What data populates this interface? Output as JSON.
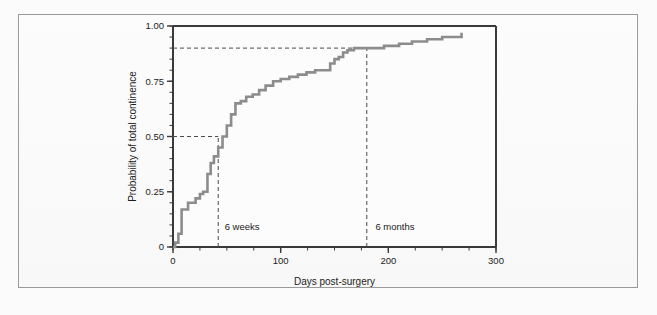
{
  "figure": {
    "background_color": "#fbfbfb",
    "panel_color": "#fcfcfc",
    "border_color": "#9a9a9a",
    "axis_color": "#3a3a3a",
    "curve_color": "#8c8c8c",
    "reference_line_color": "#4a4a4a"
  },
  "chart_data": {
    "type": "line",
    "title": "",
    "subtitle": "",
    "xlabel": "Days post-surgery",
    "ylabel": "Probability of total continence",
    "xlim": [
      0,
      300
    ],
    "ylim": [
      0,
      1.0
    ],
    "grid": false,
    "legend": "none",
    "xticks": [
      0,
      100,
      200,
      300
    ],
    "xtick_labels": [
      "0",
      "100",
      "200",
      "300"
    ],
    "xminor_tick_interval": 25,
    "yticks": [
      0,
      0.25,
      0.5,
      0.75,
      1.0
    ],
    "ytick_labels": [
      "0",
      "0.25",
      "0.50",
      "0.75",
      "1.00"
    ],
    "yminor_tick_interval": 0.05,
    "series": [
      {
        "name": "Cumulative probability of total continence",
        "style": "step-post",
        "color": "#8c8c8c",
        "x": [
          0,
          2,
          5,
          8,
          14,
          21,
          25,
          28,
          32,
          35,
          38,
          42,
          46,
          50,
          54,
          58,
          63,
          68,
          74,
          80,
          86,
          93,
          100,
          108,
          116,
          124,
          132,
          140,
          146,
          150,
          154,
          158,
          162,
          168,
          180,
          196,
          210,
          222,
          236,
          250,
          262,
          268
        ],
        "y": [
          0.0,
          0.02,
          0.06,
          0.17,
          0.2,
          0.22,
          0.24,
          0.25,
          0.33,
          0.38,
          0.41,
          0.45,
          0.5,
          0.55,
          0.6,
          0.65,
          0.66,
          0.68,
          0.69,
          0.71,
          0.73,
          0.75,
          0.76,
          0.77,
          0.78,
          0.79,
          0.8,
          0.8,
          0.83,
          0.85,
          0.86,
          0.88,
          0.89,
          0.9,
          0.9,
          0.91,
          0.92,
          0.93,
          0.94,
          0.95,
          0.95,
          0.97
        ]
      }
    ],
    "annotations": [
      {
        "label": "6 weeks",
        "type": "vertical-reference-line",
        "x": 42,
        "y_top": 0.5,
        "style": "dashed",
        "label_x": 48,
        "label_y": 0.075
      },
      {
        "label": "6 months",
        "type": "vertical-reference-line",
        "x": 180,
        "y_top": 0.9,
        "style": "dashed",
        "label_x": 188,
        "label_y": 0.075
      },
      {
        "label": "",
        "type": "horizontal-reference-line",
        "y": 0.5,
        "x_end": 42,
        "style": "dashed"
      },
      {
        "label": "",
        "type": "horizontal-reference-line",
        "y": 0.9,
        "x_end": 180,
        "style": "dashed"
      }
    ]
  }
}
